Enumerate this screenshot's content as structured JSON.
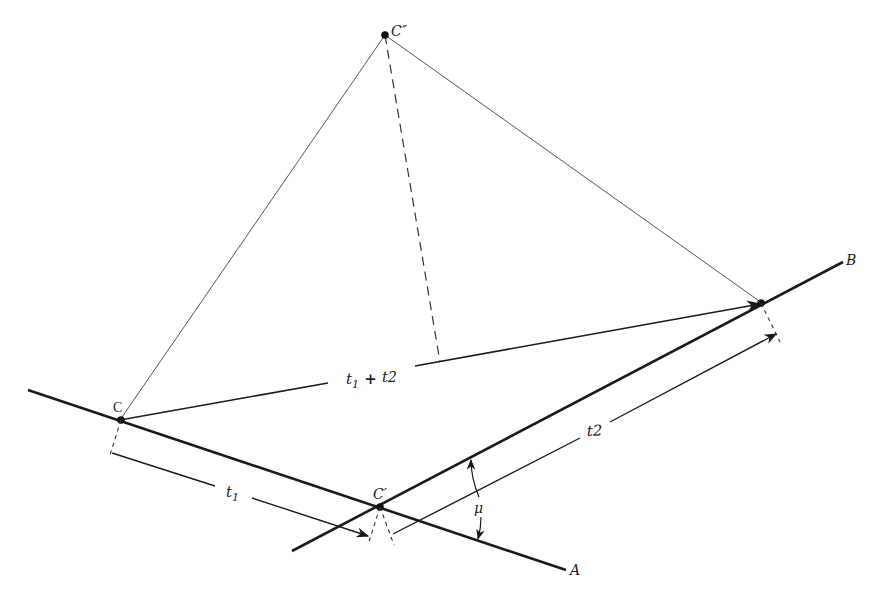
{
  "figure": {
    "type": "geometric-diagram",
    "colors": {
      "ink": "#1a1a1a",
      "thin": "#444444",
      "background": "#ffffff"
    }
  },
  "labels": {
    "c_double_prime": "C″",
    "c": "C",
    "c_prime": "C′",
    "a": "A",
    "b": "B",
    "mu": "μ",
    "t1": "t",
    "t1_sub": "1",
    "t2": "t",
    "t2_sub": "2",
    "t1_plus_t2_a": "t",
    "t1_plus_t2_a_sub": "1",
    "t1_plus_t2_plus": " + ",
    "t1_plus_t2_b": "t",
    "t1_plus_t2_b_sub": "2"
  },
  "points": {
    "C_double_prime": [
      385,
      35
    ],
    "C": [
      120,
      420
    ],
    "C_prime": [
      380,
      508
    ],
    "B_point": [
      762,
      303
    ]
  }
}
